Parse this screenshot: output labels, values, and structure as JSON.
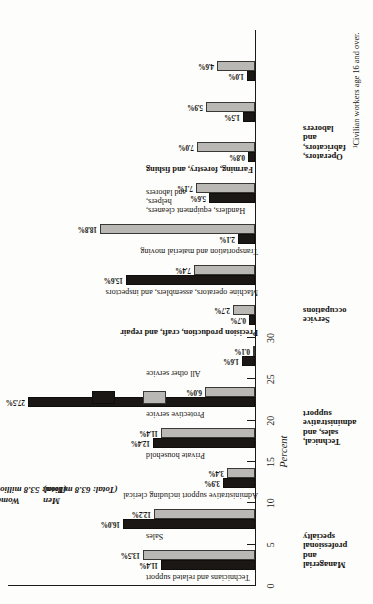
{
  "chart_data": {
    "type": "bar",
    "title": "",
    "xlabel": "Occupation",
    "ylabel": "Percent",
    "ylim": [
      0,
      30
    ],
    "grid": false,
    "legend_position": "inside-right",
    "orientation": "vertical-bars-page-rotated-90ccw",
    "axis_title_occupation": "Occupation",
    "axis_title_percent": "Percent",
    "ticks": [
      0,
      5,
      10,
      15,
      20,
      25,
      30
    ],
    "minor_ticks": [
      2.5,
      7.5,
      12.5,
      17.5,
      22.5,
      27.5
    ],
    "categories": [
      "Executive, administrative, and managerial",
      "Professional specialty",
      "Technicians and related support",
      "Sales",
      "Administrative support including clerical",
      "Private household",
      "Protective service",
      "All other service",
      "Precision production, craft, and repair",
      "Machine operators, assemblers, and inspectors",
      "Transportation and material moving",
      "Handlers, equipment cleaners, helpers, and laborers",
      "Farming, forestry, and fishing"
    ],
    "category_bold": [
      false,
      false,
      false,
      false,
      false,
      false,
      false,
      false,
      true,
      false,
      false,
      false,
      true
    ],
    "series": [
      {
        "name": "Women",
        "color": "#1a1714",
        "total": "Total: 53.8 million",
        "values": [
          11.4,
          16.0,
          3.9,
          12.4,
          27.5,
          1.6,
          0.7,
          15.6,
          2.1,
          5.6,
          0.8,
          1.5,
          1.0
        ],
        "labels": [
          "11.4%",
          "16.0%",
          "3.9%",
          "12.4%",
          "27.5%",
          "1.6%",
          "0.7%",
          "15.6%",
          "2.1%",
          "5.6%",
          "0.8%",
          "1.5%",
          "1.0%"
        ]
      },
      {
        "name": "Men",
        "color": "#b9b8b4",
        "total": "Total: 63.8 million",
        "values": [
          13.5,
          12.2,
          3.4,
          11.4,
          6.0,
          0.1,
          2.7,
          7.4,
          18.8,
          7.1,
          7.0,
          5.9,
          4.6
        ],
        "labels": [
          "13.5%",
          "12.2%",
          "3.4%",
          "11.4%",
          "6.0%",
          "0.1%",
          "2.7%",
          "7.4%",
          "18.8%",
          "7.1%",
          "7.0%",
          "5.9%",
          "4.6%"
        ]
      }
    ],
    "groups": [
      {
        "name": "Managerial\nand\nprofessional\nspecialty",
        "from": 0,
        "to": 1
      },
      {
        "name": "Technical,\nsales, and\nadministrative\nsupport",
        "from": 2,
        "to": 4
      },
      {
        "name": "Service\noccupations",
        "from": 5,
        "to": 7
      },
      {
        "name": "Operators,\nfabricators,\nand\nlaborers",
        "from": 9,
        "to": 11
      }
    ]
  },
  "legend": {
    "women_name": "Women",
    "women_total": "(Total: 53.8 million)",
    "men_name": "Men",
    "men_total": "(Total: 63.8 million)"
  },
  "footnote": "¹Civilian workers age 16 and over."
}
